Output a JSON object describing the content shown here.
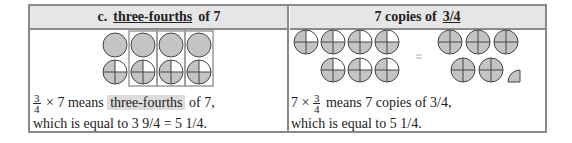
{
  "left": {
    "header": {
      "prefix": "c.",
      "underlined": "three-fourths",
      "suffix": "of 7"
    },
    "figure": {
      "top_row_full_circles": 4,
      "bottom_row_three_quarter_circles": 4,
      "boxed_columns": 3,
      "fill_color": "#c4c4c4",
      "box_color": "#9a9a9a"
    },
    "line1": {
      "frac_num": "3",
      "frac_den": "4",
      "times": "× 7",
      "means": "means",
      "highlight": "three-fourths",
      "rest": "of 7,"
    },
    "line2": "which is equal to 3 9/4 = 5 1/4."
  },
  "right": {
    "header": {
      "prefix": "7 copies of",
      "underlined": "3/4"
    },
    "figure": {
      "copies": 7,
      "result_whole_circles": 5,
      "result_remainder": "1/4",
      "equals": "=",
      "fill_color": "#c4c4c4"
    },
    "line1": {
      "lead": "7 ×",
      "frac_num": "3",
      "frac_den": "4",
      "rest": "means 7 copies of 3/4,"
    },
    "line2": "which is equal to 5 1/4."
  },
  "colors": {
    "border": "#8a8a8a",
    "header_bg": "#e6e6e6",
    "highlight_bg": "#dcdcdc"
  }
}
